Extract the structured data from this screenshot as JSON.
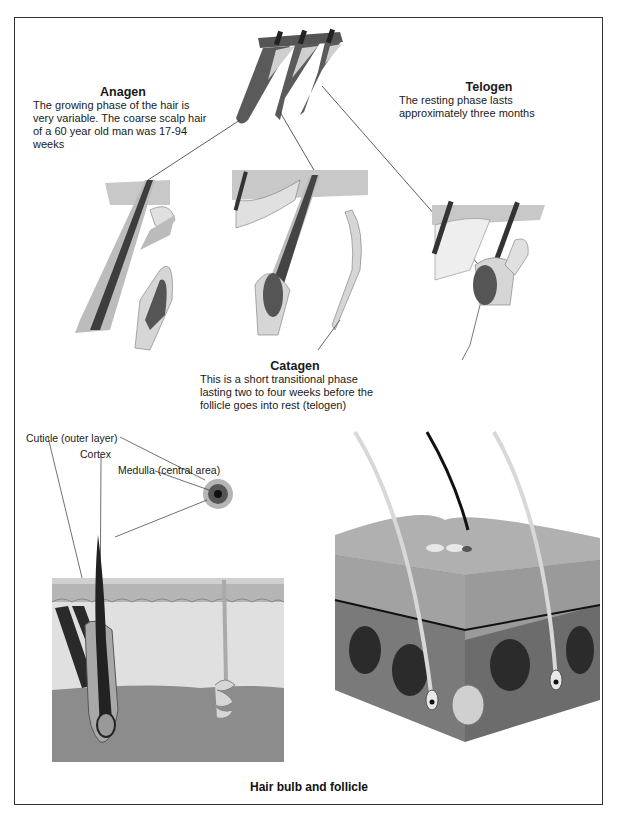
{
  "diagram": {
    "title": "Hair bulb and follicle",
    "phases": {
      "anagen": {
        "title": "Anagen",
        "text": "The growing phase of the hair is very variable. The coarse scalp hair of a 60 year old man was 17-94 weeks"
      },
      "telogen": {
        "title": "Telogen",
        "text": "The resting phase lasts approximately three months"
      },
      "catagen": {
        "title": "Catagen",
        "text": "This is a short transitional phase lasting two to four weeks before the follicle goes into rest (telogen)"
      }
    },
    "hair_structure_labels": {
      "cuticle": "Cuticle (outer layer)",
      "cortex": "Cortex",
      "medulla": "Medulla (central area)"
    },
    "colors": {
      "hair_dark": "#2a2a2a",
      "follicle_mid": "#6e6e6e",
      "tissue_light": "#d4d4d4",
      "dermis": "#8c8c8c",
      "epidermis": "#b5b5b5",
      "background": "#ffffff",
      "frame": "#333333"
    }
  }
}
